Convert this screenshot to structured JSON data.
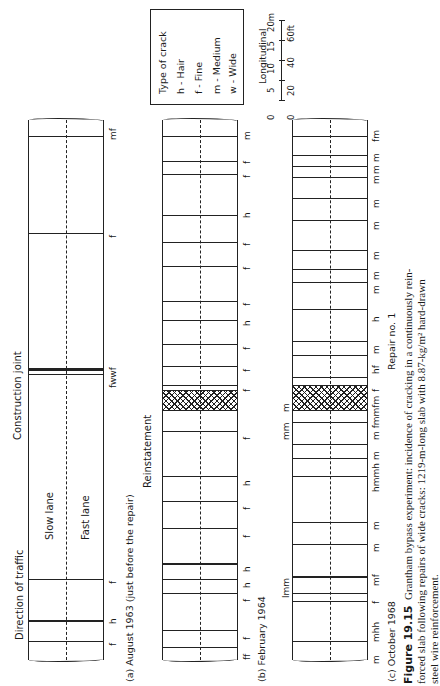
{
  "figure": {
    "number": "Figure 19.15",
    "caption": "Grantham bypass experiment: incidence of cracking in a continuously reinforced slab following repairs of wide cracks: 1219-m-long slab with 8.87-kg/m² hard-drawn steel wire reinforcement.",
    "caption_lines": [
      "Grantham bypass experiment: incidence of cracking in a continuously rein-",
      "forced slab following repairs of wide cracks: 1219-m-long slab with 8.87-kg/m² hard-drawn",
      "steel wire reinforcement."
    ]
  },
  "legend": {
    "title": "Type of crack",
    "items": [
      {
        "code": "h",
        "label": "h - Hair"
      },
      {
        "code": "f",
        "label": "f - Fine"
      },
      {
        "code": "m",
        "label": "m - Medium"
      },
      {
        "code": "w",
        "label": "w - Wide"
      }
    ]
  },
  "scale": {
    "title": "Longitudinal",
    "metres": [
      "0",
      "5",
      "10",
      "15",
      "20m"
    ],
    "feet": [
      "0",
      "20",
      "40",
      "60ft"
    ]
  },
  "annotations": {
    "direction": "Direction of traffic",
    "slow_lane": "Slow lane",
    "fast_lane": "Fast lane",
    "construction_joint": "Construction joint",
    "reinstatement": "Reinstatement",
    "repair": "Repair no. 1"
  },
  "panels": [
    {
      "id": "a",
      "label": "(a) August 1963 (just before the repair)",
      "cracks": [
        {
          "pos": 0.03,
          "type": "mf"
        },
        {
          "pos": 0.21,
          "type": "f"
        },
        {
          "pos": 0.465,
          "type": "fwwf"
        },
        {
          "pos": 0.85,
          "type": "f"
        },
        {
          "pos": 0.925,
          "type": "h"
        },
        {
          "pos": 0.965,
          "type": "f"
        }
      ]
    },
    {
      "id": "b",
      "label": "(b) February 1964",
      "cracks": [
        {
          "pos": 0.03,
          "type": "m"
        },
        {
          "pos": 0.075,
          "type": "f"
        },
        {
          "pos": 0.1,
          "type": "f"
        },
        {
          "pos": 0.175,
          "type": "h"
        },
        {
          "pos": 0.225,
          "type": "f"
        },
        {
          "pos": 0.27,
          "type": "f"
        },
        {
          "pos": 0.335,
          "type": "f"
        },
        {
          "pos": 0.37,
          "type": "h"
        },
        {
          "pos": 0.415,
          "type": "f"
        },
        {
          "pos": 0.455,
          "type": "f"
        },
        {
          "pos": 0.49,
          "type": "f"
        },
        {
          "pos": 0.575,
          "type": "f"
        },
        {
          "pos": 0.66,
          "type": "h"
        },
        {
          "pos": 0.705,
          "type": "f"
        },
        {
          "pos": 0.755,
          "type": "f"
        },
        {
          "pos": 0.82,
          "type": "h"
        },
        {
          "pos": 0.85,
          "type": "h"
        },
        {
          "pos": 0.875,
          "type": "f"
        },
        {
          "pos": 0.945,
          "type": "f"
        },
        {
          "pos": 0.975,
          "type": "ff"
        }
      ],
      "reinstatement": {
        "start": 0.5,
        "end": 0.535
      }
    },
    {
      "id": "c",
      "label": "(c) October 1968",
      "cracks": [
        {
          "pos": 0.03,
          "type": "fm"
        },
        {
          "pos": 0.065,
          "type": "m"
        },
        {
          "pos": 0.085,
          "type": "m"
        },
        {
          "pos": 0.105,
          "type": "m"
        },
        {
          "pos": 0.145,
          "type": "m"
        },
        {
          "pos": 0.185,
          "type": "m"
        },
        {
          "pos": 0.24,
          "type": "m"
        },
        {
          "pos": 0.275,
          "type": "m"
        },
        {
          "pos": 0.3,
          "type": "m"
        },
        {
          "pos": 0.35,
          "type": "h"
        },
        {
          "pos": 0.41,
          "type": "m"
        },
        {
          "pos": 0.435,
          "type": "hf"
        },
        {
          "pos": 0.475,
          "type": "f"
        },
        {
          "pos": 0.525,
          "type": "m fmmfm"
        },
        {
          "pos": 0.56,
          "type": "m"
        },
        {
          "pos": 0.615,
          "type": "hmmh"
        },
        {
          "pos": 0.66,
          "type": "m"
        },
        {
          "pos": 0.745,
          "type": "m"
        },
        {
          "pos": 0.785,
          "type": "m"
        },
        {
          "pos": 0.845,
          "type": "mf"
        },
        {
          "pos": 0.875,
          "type": "f"
        },
        {
          "pos": 0.89,
          "type": "m"
        },
        {
          "pos": 0.92,
          "type": "mhh"
        },
        {
          "pos": 0.965,
          "type": "m"
        }
      ],
      "reinstatement": {
        "start": 0.49,
        "end": 0.535
      },
      "side_labels": [
        {
          "pos": 0.425,
          "text": "mm"
        },
        {
          "pos": 0.51,
          "text": "m"
        },
        {
          "pos": 0.87,
          "text": "lmm"
        }
      ]
    }
  ]
}
